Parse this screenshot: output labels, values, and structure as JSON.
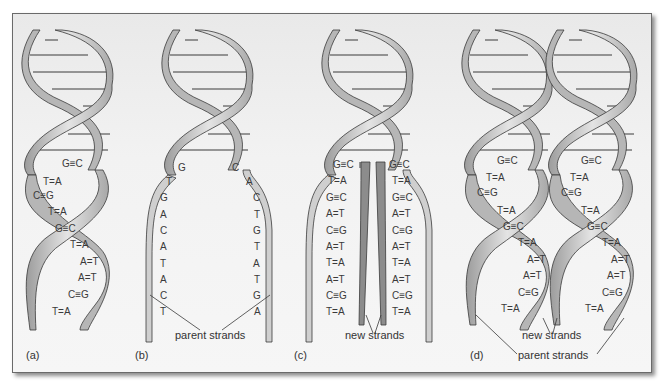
{
  "figure": {
    "panels": [
      {
        "label": "(a)"
      },
      {
        "label": "(b)",
        "callout": "parent strands"
      },
      {
        "label": "(c)",
        "callout": "new strands"
      },
      {
        "label": "(d)",
        "callout_new": "new strands",
        "callout_parent": "parent strands"
      }
    ],
    "panel_a_pairs": [
      "G≡C",
      "T=A",
      "C≡G",
      "T=A",
      "G≡C",
      "T=A",
      "A=T",
      "A=T",
      "C≡G",
      "T=A"
    ],
    "panel_b_left": [
      "G",
      "T",
      "G",
      "A",
      "C",
      "A",
      "T",
      "A",
      "C",
      "T"
    ],
    "panel_b_right": [
      "C",
      "A",
      "C",
      "T",
      "G",
      "T",
      "A",
      "T",
      "G",
      "A"
    ],
    "panel_c_left": [
      "G≡C",
      "T=A",
      "G≡C",
      "A=T",
      "C≡G",
      "A=T",
      "T=A",
      "A=T",
      "C≡G",
      "T=A"
    ],
    "panel_c_right": [
      "G≡C",
      "T=A",
      "G≡C",
      "A=T",
      "C≡G",
      "A=T",
      "T=A",
      "A=T",
      "C≡G",
      "T=A"
    ],
    "panel_d_pairs": [
      "G≡C",
      "T=A",
      "C≡G",
      "T=A",
      "G≡C",
      "T=A",
      "A=T",
      "A=T",
      "C≡G",
      "T=A"
    ],
    "colors": {
      "ribbon": "#c8c8c8",
      "ribbon_dark": "#9a9a9a",
      "new_strand": "#8c8c8c",
      "outline": "#3a3a3a",
      "background": "#f2f2f2"
    }
  }
}
